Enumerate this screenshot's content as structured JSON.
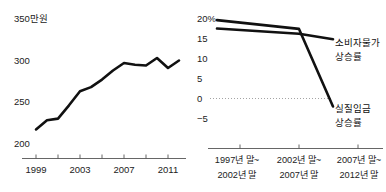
{
  "chart_data": [
    {
      "type": "line",
      "id": "monthly-wage",
      "title": "",
      "ylabel": "350만원",
      "xlabel": "",
      "unit_note": "350만원",
      "ylim": [
        195,
        355
      ],
      "yticks": [
        200,
        250,
        300
      ],
      "ytick_labels": [
        "200",
        "250",
        "300"
      ],
      "xlim": [
        1998,
        2013
      ],
      "xticks": [
        1999,
        2001,
        2003,
        2005,
        2007,
        2009,
        2011,
        2013
      ],
      "xtick_labels": [
        "1999",
        "2003",
        "2007",
        "2011"
      ],
      "labeled_xticks": [
        1999,
        2003,
        2007,
        2011
      ],
      "grid": false,
      "legend": "none",
      "x": [
        1999,
        2000,
        2001,
        2002,
        2003,
        2004,
        2005,
        2006,
        2007,
        2008,
        2009,
        2010,
        2011,
        2012
      ],
      "values": [
        217,
        228,
        230,
        246,
        263,
        268,
        277,
        288,
        297,
        295,
        294,
        303,
        291,
        300
      ]
    },
    {
      "type": "line",
      "id": "cpi-vs-real-wage",
      "title": "",
      "ylabel": "",
      "xlabel": "",
      "ylim": [
        -7,
        21
      ],
      "yticks": [
        20,
        15,
        10,
        5,
        0,
        -5
      ],
      "ytick_labels": [
        "20%",
        "15",
        "10",
        "5",
        "0",
        "−5"
      ],
      "grid": false,
      "zero_line": true,
      "legend": "right-inline",
      "categories": [
        "1997년 말~\n2002년 말",
        "2002년 말~\n2007년 말",
        "2007년 말~\n2012년 말"
      ],
      "category_lines": [
        [
          "1997년 말~",
          "2002년 말"
        ],
        [
          "2002년 말~",
          "2007년 말"
        ],
        [
          "2007년 말~",
          "2012년 말"
        ]
      ],
      "series": [
        {
          "name": "소비자물가\n상승률",
          "name_lines": [
            "소비자물가",
            "상승률"
          ],
          "values": [
            17.5,
            16.2,
            14.8
          ]
        },
        {
          "name": "실질임금\n상승률",
          "name_lines": [
            "실질임금",
            "상승률"
          ],
          "values": [
            19.6,
            17.4,
            -2.0
          ]
        }
      ]
    }
  ],
  "left_chart": {
    "unit_label": "350만원",
    "ytick_labels": [
      "300",
      "250",
      "200"
    ],
    "xtick_labels": [
      "1999",
      "2003",
      "2007",
      "2011"
    ]
  },
  "right_chart": {
    "ytick_labels": [
      "20%",
      "15",
      "10",
      "5",
      "0",
      "−5"
    ],
    "series_labels": {
      "cpi_line1": "소비자물가",
      "cpi_line2": "상승률",
      "wage_line1": "실질임금",
      "wage_line2": "상승률"
    },
    "xcat_labels": [
      {
        "line1": "1997년 말~",
        "line2": "2002년 말"
      },
      {
        "line1": "2002년 말~",
        "line2": "2007년 말"
      },
      {
        "line1": "2007년 말~",
        "line2": "2012년 말"
      }
    ]
  },
  "colors": {
    "line": "#111111",
    "axis": "#555555",
    "zero": "#9a9a9a",
    "text": "#222222",
    "background": "#ffffff"
  }
}
